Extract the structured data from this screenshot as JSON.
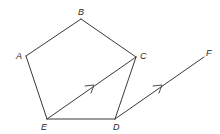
{
  "diagram": {
    "type": "geometry",
    "stroke_color": "#3a3a3a",
    "label_color": "#2a2a2a",
    "points": {
      "A": {
        "label": "A",
        "x": 26,
        "y": 56
      },
      "B": {
        "label": "B",
        "x": 81,
        "y": 19
      },
      "C": {
        "label": "C",
        "x": 136,
        "y": 57
      },
      "D": {
        "label": "D",
        "x": 115,
        "y": 119
      },
      "E": {
        "label": "E",
        "x": 47,
        "y": 119
      },
      "F": {
        "label": "F",
        "x": 204,
        "y": 57
      }
    },
    "segments": [
      {
        "from": "A",
        "to": "B"
      },
      {
        "from": "B",
        "to": "C"
      },
      {
        "from": "C",
        "to": "D"
      },
      {
        "from": "D",
        "to": "E"
      },
      {
        "from": "E",
        "to": "A"
      },
      {
        "from": "E",
        "to": "C",
        "parallel_mark": true
      },
      {
        "from": "D",
        "to": "F",
        "parallel_mark": true
      }
    ],
    "annotations": [
      "EC parallel to DF (single arrow marks)"
    ]
  }
}
